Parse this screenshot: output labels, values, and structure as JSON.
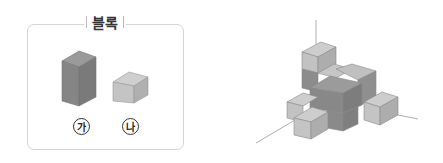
{
  "panel": {
    "title": "블록"
  },
  "blocks": [
    {
      "id": "ga",
      "label": "가",
      "shape": "tall-rectangular-prism",
      "color": "#8a8a8a"
    },
    {
      "id": "na",
      "label": "나",
      "shape": "cube",
      "color": "#bdbdbd"
    }
  ]
}
